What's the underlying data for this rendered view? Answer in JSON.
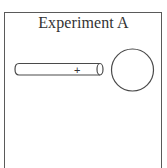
{
  "panel": {
    "title": "Experiment A"
  },
  "rod": {
    "charge_label": "+",
    "stroke_color": "#4a4a4a"
  },
  "sphere": {
    "stroke_color": "#4a4a4a"
  },
  "colors": {
    "border": "#5a5a5a",
    "text": "#333333",
    "background": "#ffffff"
  }
}
